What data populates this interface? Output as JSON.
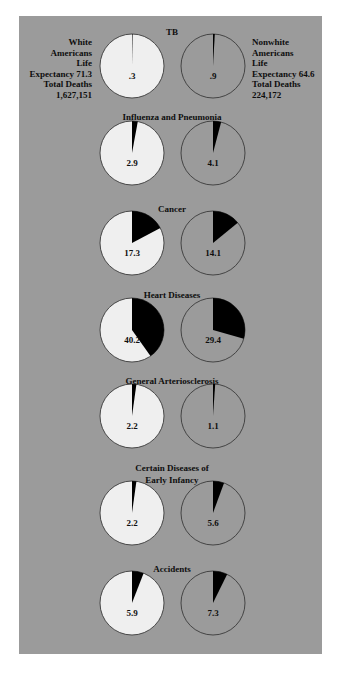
{
  "chart_data": {
    "type": "pie",
    "title": "",
    "groups": [
      {
        "name": "White Americans",
        "legend_lines": [
          "White",
          "Americans",
          "Life",
          "Expectancy 71.3",
          "Total Deaths",
          "1,627,151"
        ],
        "life_expectancy": 71.3,
        "total_deaths": 1627151,
        "pie_fill": "#efefef"
      },
      {
        "name": "Nonwhite Americans",
        "legend_lines": [
          "Nonwhite",
          "Americans",
          "Life",
          "Expectancy 64.6",
          "Total Deaths",
          "224,172"
        ],
        "life_expectancy": 64.6,
        "total_deaths": 224172,
        "pie_fill": "#9b9b9b"
      }
    ],
    "charts": [
      {
        "title_lines": [
          "TB"
        ],
        "white": 0.3,
        "white_label": ".3",
        "nonwhite": 0.9,
        "nonwhite_label": ".9"
      },
      {
        "title_lines": [
          "Influenza and Pneumonia"
        ],
        "white": 2.9,
        "white_label": "2.9",
        "nonwhite": 4.1,
        "nonwhite_label": "4.1"
      },
      {
        "title_lines": [
          "Cancer"
        ],
        "white": 17.3,
        "white_label": "17.3",
        "nonwhite": 14.1,
        "nonwhite_label": "14.1"
      },
      {
        "title_lines": [
          "Heart Diseases"
        ],
        "white": 40.2,
        "white_label": "40.2",
        "nonwhite": 29.4,
        "nonwhite_label": "29.4"
      },
      {
        "title_lines": [
          "General Arteriosclerosis"
        ],
        "white": 2.2,
        "white_label": "2.2",
        "nonwhite": 1.1,
        "nonwhite_label": "1.1"
      },
      {
        "title_lines": [
          "Certain Diseases of",
          "Early Infancy"
        ],
        "white": 2.2,
        "white_label": "2.2",
        "nonwhite": 5.6,
        "nonwhite_label": "5.6"
      },
      {
        "title_lines": [
          "Accidents"
        ],
        "white": 5.9,
        "white_label": "5.9",
        "nonwhite": 7.3,
        "nonwhite_label": "7.3"
      }
    ],
    "units": "percent of total deaths",
    "colors": {
      "slice": "#000000",
      "panel": "#9b9b9b",
      "white_pie": "#efefef",
      "outline": "#3a3a3a"
    }
  }
}
